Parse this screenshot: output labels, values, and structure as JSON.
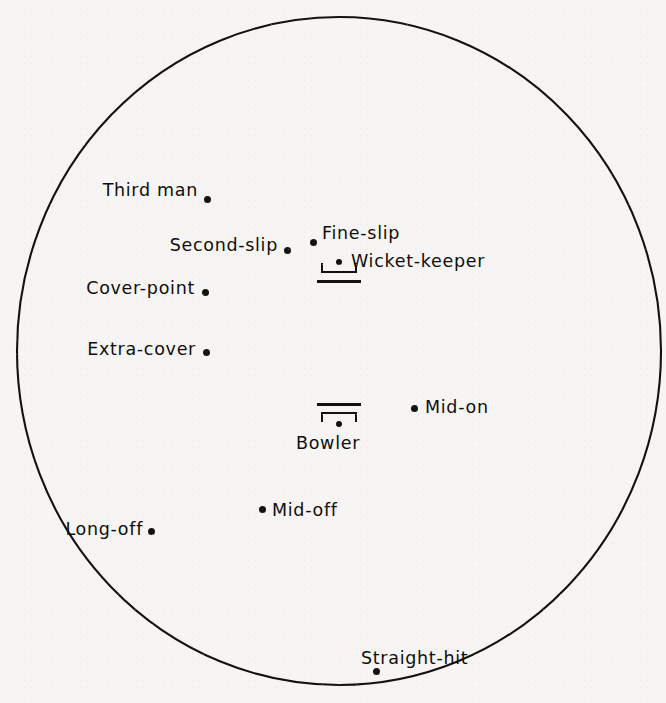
{
  "diagram": {
    "type": "cricket-field-diagram",
    "background_color": "#f6f5f3",
    "ink_color": "#14120e",
    "boundary": {
      "shape": "circle",
      "center_x": 339,
      "center_y": 351,
      "radius_x": 322,
      "radius_y": 334,
      "stroke_width": 2.1
    },
    "pitch": {
      "keeper_crease": {
        "name": "wicket-keeper-crease",
        "center_x": 339,
        "stumps_y": 262,
        "popping_crease_y": 272,
        "bowling_crease_y": 282,
        "width": 44
      },
      "bowler_crease": {
        "name": "bowler-crease",
        "center_x": 339,
        "stumps_y": 424,
        "popping_crease_y": 414,
        "bowling_crease_y": 404,
        "width": 44
      }
    },
    "positions": [
      {
        "id": "third-man",
        "label": "Third man",
        "dot_x": 207,
        "dot_y": 199,
        "label_x": 198,
        "label_y": 191,
        "label_side": "left"
      },
      {
        "id": "fine-slip",
        "label": "Fine-slip",
        "dot_x": 313,
        "dot_y": 242,
        "label_x": 322,
        "label_y": 234,
        "label_side": "right"
      },
      {
        "id": "second-slip",
        "label": "Second-slip",
        "dot_x": 287,
        "dot_y": 250,
        "label_x": 278,
        "label_y": 246,
        "label_side": "left"
      },
      {
        "id": "wicket-keeper",
        "label": "Wicket-keeper",
        "dot_x": 339,
        "dot_y": 262,
        "label_x": 351,
        "label_y": 262,
        "label_side": "right"
      },
      {
        "id": "cover-point",
        "label": "Cover-point",
        "dot_x": 205,
        "dot_y": 292,
        "label_x": 195,
        "label_y": 289,
        "label_side": "left"
      },
      {
        "id": "extra-cover",
        "label": "Extra-cover",
        "dot_x": 206,
        "dot_y": 352,
        "label_x": 196,
        "label_y": 350,
        "label_side": "left"
      },
      {
        "id": "mid-on",
        "label": "Mid-on",
        "dot_x": 414,
        "dot_y": 408,
        "label_x": 425,
        "label_y": 408,
        "label_side": "right"
      },
      {
        "id": "bowler",
        "label": "Bowler",
        "dot_x": 339,
        "dot_y": 424,
        "label_x": 296,
        "label_y": 444,
        "label_side": "right"
      },
      {
        "id": "mid-off",
        "label": "Mid-off",
        "dot_x": 262,
        "dot_y": 509,
        "label_x": 272,
        "label_y": 511,
        "label_side": "right"
      },
      {
        "id": "long-off",
        "label": "Long-off",
        "dot_x": 151,
        "dot_y": 531,
        "label_x": 143,
        "label_y": 530,
        "label_side": "left"
      },
      {
        "id": "straight-hit",
        "label": "Straight-hit",
        "dot_x": 376,
        "dot_y": 671,
        "label_x": 361,
        "label_y": 659,
        "label_side": "right"
      }
    ]
  }
}
